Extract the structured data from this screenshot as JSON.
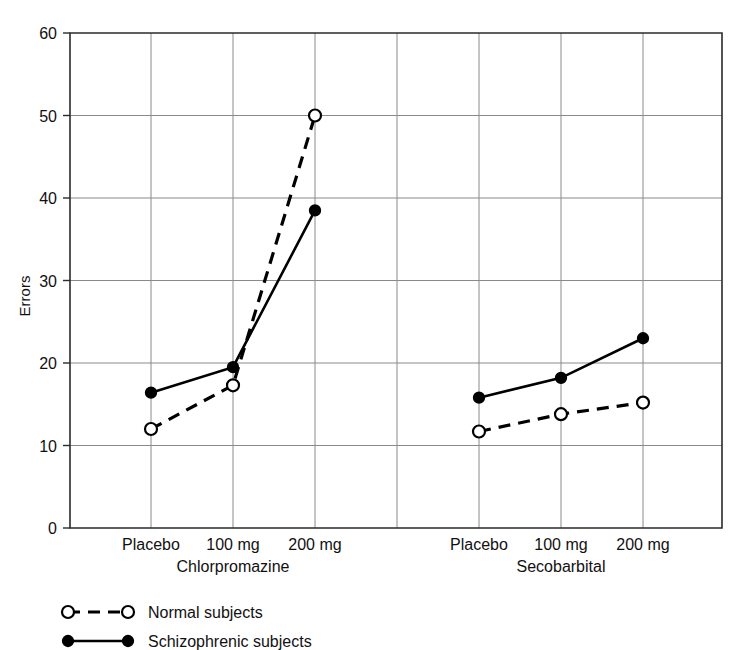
{
  "chart_data": {
    "type": "line",
    "title": "",
    "xlabel": "",
    "ylabel": "Errors",
    "ylim": [
      0,
      60
    ],
    "yticks": [
      0,
      10,
      20,
      30,
      40,
      50,
      60
    ],
    "ytick_labels": [
      "0",
      "10",
      "20",
      "30",
      "40",
      "50",
      "60"
    ],
    "grid": true,
    "legend_position": "below-left",
    "groups": [
      {
        "name": "Chlorpromazine",
        "categories": [
          "Placebo",
          "100 mg",
          "200 mg"
        ]
      },
      {
        "name": "Secobarbital",
        "categories": [
          "Placebo",
          "100 mg",
          "200 mg"
        ]
      }
    ],
    "categories": [
      "Placebo",
      "100 mg",
      "200 mg",
      "Placebo",
      "100 mg",
      "200 mg"
    ],
    "series": [
      {
        "name": "Normal subjects",
        "marker": "open-circle",
        "line_style": "dashed",
        "color": "#000000",
        "values": [
          12.0,
          17.3,
          50.0,
          11.7,
          13.8,
          15.2
        ]
      },
      {
        "name": "Schizophrenic subjects",
        "marker": "filled-circle",
        "line_style": "solid",
        "color": "#000000",
        "values": [
          16.4,
          19.5,
          38.5,
          15.8,
          18.2,
          23.0
        ]
      }
    ],
    "legend": [
      {
        "label": "Normal subjects",
        "marker": "open-circle",
        "line_style": "dashed"
      },
      {
        "label": "Schizophrenic subjects",
        "marker": "filled-circle",
        "line_style": "solid"
      }
    ]
  }
}
